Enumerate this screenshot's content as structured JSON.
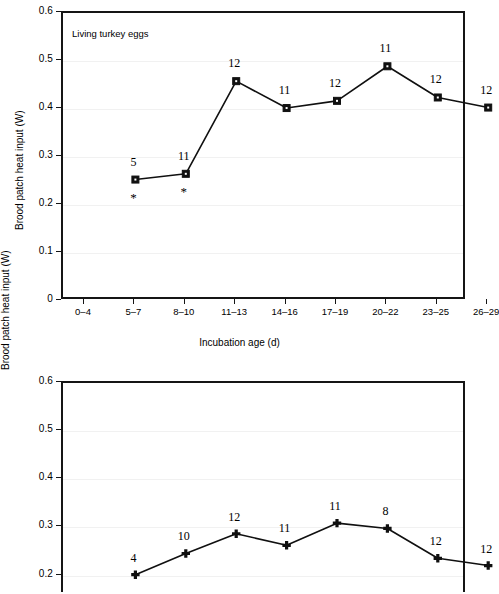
{
  "figure": {
    "axis_title_y": "Brood patch heat input (W)",
    "axis_title_x": "Incubation age (d)"
  },
  "chart_data": [
    {
      "type": "line",
      "title": "Living turkey eggs",
      "xlabel": "Incubation age (d)",
      "ylabel": "Brood patch heat input (W)",
      "categories": [
        "0–4",
        "5–7",
        "8–10",
        "11–13",
        "14–16",
        "17–19",
        "20–22",
        "23–25",
        "26–29"
      ],
      "ytick_labels": [
        "0",
        "0.1",
        "0.2",
        "0.3",
        "0.4",
        "0.5",
        "0.6"
      ],
      "ylim": [
        0,
        0.6
      ],
      "grid": true,
      "legend": "none",
      "marker": "filled-square",
      "points": [
        {
          "category": "0–4",
          "value": null,
          "label": "",
          "significance": ""
        },
        {
          "category": "5–7",
          "value": 0.253,
          "label": "5",
          "significance": "*"
        },
        {
          "category": "8–10",
          "value": 0.265,
          "label": "11",
          "significance": "*"
        },
        {
          "category": "11–13",
          "value": 0.458,
          "label": "12",
          "significance": ""
        },
        {
          "category": "14–16",
          "value": 0.402,
          "label": "11",
          "significance": ""
        },
        {
          "category": "17–19",
          "value": 0.417,
          "label": "12",
          "significance": ""
        },
        {
          "category": "20–22",
          "value": 0.489,
          "label": "11",
          "significance": ""
        },
        {
          "category": "23–25",
          "value": 0.424,
          "label": "12",
          "significance": ""
        },
        {
          "category": "26–29",
          "value": 0.403,
          "label": "12",
          "significance": ""
        }
      ]
    },
    {
      "type": "line",
      "title": "Killed turkey eggs",
      "xlabel": "Incubation age (d)",
      "ylabel": "Brood patch heat input (W)",
      "categories": [
        "0–4",
        "5–7",
        "8–10",
        "11–13",
        "14–16",
        "17–19",
        "20–22",
        "23–25",
        "26–29"
      ],
      "ytick_labels": [
        "0.2",
        "0.3",
        "0.4",
        "0.5",
        "0.6"
      ],
      "ylim": [
        0.18,
        0.6
      ],
      "grid": true,
      "legend": "none",
      "marker": "filled-diamond",
      "cropped": true,
      "points": [
        {
          "category": "0–4",
          "value": null,
          "label": "",
          "significance": ""
        },
        {
          "category": "5–7",
          "value": 0.202,
          "label": "4",
          "significance": ""
        },
        {
          "category": "8–10",
          "value": 0.246,
          "label": "10",
          "significance": ""
        },
        {
          "category": "11–13",
          "value": 0.287,
          "label": "12",
          "significance": ""
        },
        {
          "category": "14–16",
          "value": 0.263,
          "label": "11",
          "significance": ""
        },
        {
          "category": "17–19",
          "value": 0.309,
          "label": "11",
          "significance": ""
        },
        {
          "category": "20–22",
          "value": 0.298,
          "label": "8",
          "significance": ""
        },
        {
          "category": "23–25",
          "value": 0.236,
          "label": "12",
          "significance": ""
        },
        {
          "category": "26–29",
          "value": 0.221,
          "label": "12",
          "significance": ""
        }
      ]
    }
  ]
}
